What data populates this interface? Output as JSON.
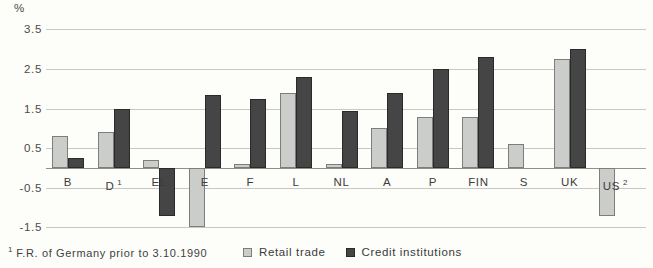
{
  "chart": {
    "unit_label": "%",
    "footnote_marker": "1",
    "footnote_text": "F.R. of Germany prior to 3.10.1990"
  },
  "chart_data": {
    "type": "bar",
    "title": "",
    "xlabel": "",
    "ylabel": "%",
    "ylim": [
      -1.5,
      3.5
    ],
    "yticks": [
      3.5,
      2.5,
      1.5,
      0.5,
      -0.5,
      -1.5
    ],
    "grid": true,
    "legend_position": "bottom",
    "categories": [
      "B",
      "D",
      "EL",
      "E",
      "F",
      "L",
      "NL",
      "A",
      "P",
      "FIN",
      "S",
      "UK",
      "US"
    ],
    "category_superscripts": [
      "",
      "1",
      "",
      "",
      "",
      "",
      "",
      "",
      "",
      "",
      "",
      "",
      "2"
    ],
    "series": [
      {
        "name": "Retail trade",
        "color": "#cbcdca",
        "border_color": "#7d7d7d",
        "values": [
          0.8,
          0.9,
          0.2,
          -1.5,
          0.1,
          1.9,
          0.1,
          1.0,
          1.3,
          1.3,
          0.6,
          2.75,
          -1.2
        ]
      },
      {
        "name": "Credit institutions",
        "color": "#454545",
        "border_color": "#2a2a2a",
        "values": [
          0.25,
          1.5,
          -1.2,
          1.85,
          1.75,
          2.3,
          1.45,
          1.9,
          2.5,
          2.8,
          null,
          3.0,
          null
        ]
      }
    ]
  }
}
